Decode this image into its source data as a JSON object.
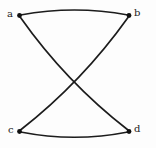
{
  "figure": {
    "background_color": "#fdfdfd",
    "edge_color": "#1c1c1c",
    "vertex_color": "#101010",
    "width": 156,
    "height": 148
  },
  "vertices": [
    {
      "id": "a",
      "label": "a",
      "cx": 19.5,
      "cy": 15.5,
      "label_x": 7,
      "label_y": 9,
      "label_name": "vertex-label-a"
    },
    {
      "id": "b",
      "label": "b",
      "cx": 129.0,
      "cy": 15.5,
      "label_x": 134,
      "label_y": 8,
      "label_name": "vertex-label-b"
    },
    {
      "id": "c",
      "label": "c",
      "cx": 19.5,
      "cy": 131.5,
      "label_x": 8,
      "label_y": 125,
      "label_name": "vertex-label-c"
    },
    {
      "id": "d",
      "label": "d",
      "cx": 129.0,
      "cy": 131.5,
      "label_x": 134,
      "label_y": 124,
      "label_name": "vertex-label-d"
    }
  ],
  "edges": [
    {
      "id": "ab",
      "from": "a",
      "to": "b",
      "style": "curved-up",
      "path": "M 20.5 15.0 Q 74.5 5.0 128.0 15.0"
    },
    {
      "id": "cd",
      "from": "c",
      "to": "d",
      "style": "curved-down",
      "path": "M 20.5 132.0 Q 74.5 142.5 128.0 132.0"
    },
    {
      "id": "ad",
      "from": "a",
      "to": "d",
      "style": "curved-diagonal",
      "path": "M 20.5 17.5 Q 66.0 82.0 128.0 130.0"
    },
    {
      "id": "bc",
      "from": "b",
      "to": "c",
      "style": "curved-diagonal",
      "path": "M 128.0 17.5 Q 82.0 82.0 20.5 130.0"
    }
  ],
  "crossing_point": {
    "x": 75,
    "y": 88
  },
  "vertex_radius": 2.4
}
